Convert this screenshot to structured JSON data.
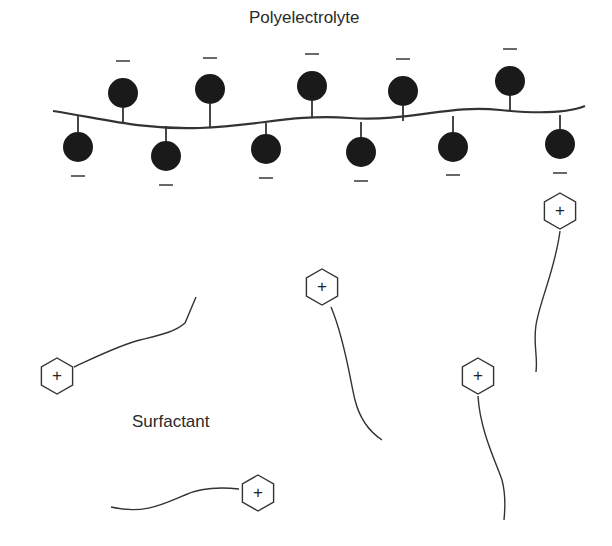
{
  "labels": {
    "polyelectrolyte": "Polyelectrolyte",
    "surfactant": "Surfactant"
  },
  "polymer": {
    "backbone_path": "M53,111 C100,118 140,130 200,128 C260,126 290,114 350,118 C410,122 450,104 500,110 C540,114 570,112 585,106",
    "bead_color": "#1a1a1a",
    "charge_symbol": "−",
    "beads": [
      {
        "cx": 78,
        "cy": 147,
        "r": 15,
        "anchor_y": 116,
        "minus_y": 176,
        "side": "below"
      },
      {
        "cx": 123,
        "cy": 93,
        "r": 15,
        "anchor_y": 122,
        "minus_y": 61,
        "side": "above"
      },
      {
        "cx": 166,
        "cy": 156,
        "r": 15,
        "anchor_y": 126,
        "minus_y": 185,
        "side": "below"
      },
      {
        "cx": 210,
        "cy": 89,
        "r": 15,
        "anchor_y": 128,
        "minus_y": 58,
        "side": "above"
      },
      {
        "cx": 266,
        "cy": 149,
        "r": 15,
        "anchor_y": 123,
        "minus_y": 178,
        "side": "below"
      },
      {
        "cx": 312,
        "cy": 86,
        "r": 15,
        "anchor_y": 118,
        "minus_y": 54,
        "side": "above"
      },
      {
        "cx": 361,
        "cy": 152,
        "r": 15,
        "anchor_y": 122,
        "minus_y": 181,
        "side": "below"
      },
      {
        "cx": 403,
        "cy": 91,
        "r": 15,
        "anchor_y": 121,
        "minus_y": 59,
        "side": "above"
      },
      {
        "cx": 453,
        "cy": 147,
        "r": 15,
        "anchor_y": 116,
        "minus_y": 175,
        "side": "below"
      },
      {
        "cx": 510,
        "cy": 81,
        "r": 15,
        "anchor_y": 110,
        "minus_y": 49,
        "side": "above"
      },
      {
        "cx": 560,
        "cy": 144,
        "r": 15,
        "anchor_y": 115,
        "minus_y": 173,
        "side": "below"
      }
    ]
  },
  "surfactants": [
    {
      "hx": 560,
      "hy": 211,
      "head_symbol": "+",
      "tail": "M560,231 C555,270 540,300 536,325 C533,345 538,355 536,372"
    },
    {
      "hx": 322,
      "hy": 287,
      "head_symbol": "+",
      "tail": "M331,307 C345,340 350,380 355,400 C360,420 370,432 382,440"
    },
    {
      "hx": 478,
      "hy": 376,
      "head_symbol": "+",
      "tail": "M478,396 C480,430 495,460 502,480 C506,495 505,510 504,520"
    },
    {
      "hx": 57,
      "hy": 376,
      "head_symbol": "+",
      "tail": "M74,367 C100,355 120,345 140,340 C160,335 175,332 185,323 L196,297"
    },
    {
      "hx": 258,
      "hy": 493,
      "head_symbol": "+",
      "tail": "M239,489 C220,487 200,488 185,495 C165,503 145,515 111,507"
    }
  ]
}
